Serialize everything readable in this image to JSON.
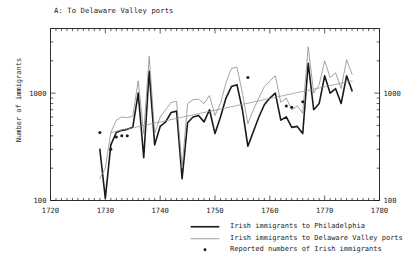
{
  "figure": {
    "panel_title": "A: To Delaware Valley ports",
    "width": 416,
    "height": 262,
    "background": "#ffffff",
    "ink_color": "#1a1a1a",
    "secondary_color": "#8c8c8c"
  },
  "legend": {
    "position": "below-axes-right",
    "entries": [
      {
        "key": "solid-thick-line",
        "label": "Irish immigrants to Philadelphia",
        "color": "#1a1a1a"
      },
      {
        "key": "thin-line",
        "label": "Irish immigrants to Delaware Valley ports",
        "color": "#8c8c8c"
      },
      {
        "key": "dot-marker",
        "label": "Reported numbers of Irish immigrants",
        "color": "#1a1a1a"
      }
    ]
  },
  "chart_data": {
    "type": "line",
    "title": "A: To Delaware Valley ports",
    "xlabel": "",
    "ylabel": "Number of immigrants",
    "yscale": "log",
    "ylim": [
      100,
      4000
    ],
    "xlim": [
      1720,
      1780
    ],
    "grid": false,
    "xticks": [
      1720,
      1730,
      1740,
      1750,
      1760,
      1770,
      1780
    ],
    "xtick_labels": [
      "1720",
      "1730",
      "1740",
      "1750",
      "1760",
      "1770",
      "1780"
    ],
    "yticks": [
      100,
      1000
    ],
    "ytick_labels": [
      "100",
      "1000"
    ],
    "ytick_labels_right": [
      "100",
      "1000"
    ],
    "ytick_minor": [
      200,
      300,
      400,
      500,
      600,
      700,
      800,
      900,
      2000,
      3000
    ],
    "xtick_minor_step": 1,
    "axis_labels_both_sides": true,
    "series": [
      {
        "name": "Irish immigrants to Philadelphia",
        "style": "solid",
        "linewidth": 1.6,
        "color": "#1a1a1a",
        "x": [
          1729,
          1730,
          1731,
          1732,
          1733,
          1734,
          1735,
          1736,
          1737,
          1738,
          1739,
          1740,
          1741,
          1742,
          1743,
          1744,
          1745,
          1746,
          1747,
          1748,
          1749,
          1750,
          1751,
          1752,
          1753,
          1754,
          1755,
          1756,
          1757,
          1758,
          1759,
          1760,
          1761,
          1762,
          1763,
          1764,
          1765,
          1766,
          1767,
          1768,
          1769,
          1770,
          1771,
          1772,
          1773,
          1774,
          1775
        ],
        "y": [
          300,
          105,
          330,
          430,
          450,
          460,
          480,
          1000,
          250,
          1600,
          330,
          490,
          540,
          660,
          680,
          160,
          530,
          600,
          620,
          540,
          700,
          420,
          600,
          900,
          1150,
          1200,
          700,
          320,
          440,
          600,
          780,
          900,
          1000,
          560,
          600,
          480,
          490,
          420,
          1900,
          700,
          800,
          1450,
          1000,
          1100,
          800,
          1450,
          1050
        ]
      },
      {
        "name": "Irish immigrants to Delaware Valley ports",
        "style": "solid",
        "linewidth": 0.8,
        "color": "#8c8c8c",
        "x": [
          1729,
          1730,
          1731,
          1732,
          1733,
          1734,
          1735,
          1736,
          1737,
          1738,
          1739,
          1740,
          1741,
          1742,
          1743,
          1744,
          1745,
          1746,
          1747,
          1748,
          1749,
          1750,
          1751,
          1752,
          1753,
          1754,
          1755,
          1756,
          1757,
          1758,
          1759,
          1760,
          1761,
          1762,
          1763,
          1764,
          1765,
          1766,
          1767,
          1768,
          1769,
          1770,
          1771,
          1772,
          1773,
          1774,
          1775
        ],
        "y": [
          160,
          200,
          430,
          560,
          600,
          590,
          610,
          1300,
          420,
          2200,
          420,
          600,
          700,
          820,
          840,
          200,
          800,
          870,
          880,
          800,
          950,
          620,
          800,
          1250,
          1700,
          1750,
          1000,
          520,
          700,
          900,
          1150,
          1300,
          1450,
          820,
          900,
          700,
          760,
          650,
          2700,
          1000,
          1200,
          2000,
          1400,
          1550,
          1100,
          2050,
          1500
        ]
      },
      {
        "name": "Trend line",
        "style": "solid",
        "linewidth": 0.7,
        "color": "#8c8c8c",
        "x": [
          1731,
          1775
        ],
        "y": [
          430,
          1300
        ]
      }
    ],
    "scatter": {
      "name": "Reported numbers of Irish immigrants",
      "marker": "dot",
      "color": "#1a1a1a",
      "x": [
        1729,
        1731,
        1732,
        1733,
        1734,
        1756,
        1763,
        1764,
        1766
      ],
      "y": [
        430,
        300,
        390,
        400,
        400,
        1400,
        760,
        740,
        830
      ]
    }
  }
}
